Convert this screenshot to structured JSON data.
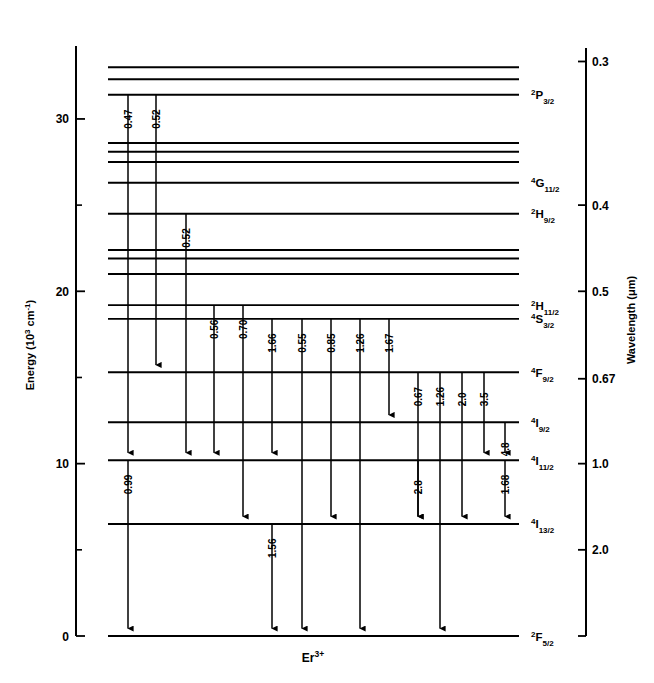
{
  "figure": {
    "ion_label": "Er 3+",
    "ion_label_base": "Er",
    "ion_label_sup": "3+"
  },
  "left_axis": {
    "title": "Energy (10³ cm⁻¹)",
    "title_main": "Energy (10",
    "title_sup": "3",
    "title_unit": " cm",
    "title_unit_sup": "-1",
    "title_close": ")",
    "major_ticks": [
      "0",
      "10",
      "20",
      "30"
    ],
    "minor_ticks": [
      "5",
      "15",
      "25"
    ],
    "range_min": 0,
    "range_max": 34
  },
  "right_axis": {
    "title": "Wavelength (μm)",
    "ticks": [
      "0.3",
      "0.4",
      "0.5",
      "0.67",
      "1.0",
      "2.0"
    ]
  },
  "chart_data": {
    "type": "diagram",
    "xlabel": "",
    "ylabel": "Energy (10³ cm⁻¹)",
    "ylim": [
      0,
      34
    ],
    "secondary_axis": {
      "label": "Wavelength (μm)",
      "ticks": [
        0.3,
        0.4,
        0.5,
        0.67,
        1.0,
        2.0
      ]
    },
    "levels": [
      {
        "label": "",
        "energy": 33.0,
        "term": "",
        "labeled": false
      },
      {
        "label": "",
        "energy": 32.3,
        "term": "",
        "labeled": false
      },
      {
        "label": "2P3/2",
        "energy": 31.4,
        "term_main": "P",
        "term_pre": "2",
        "term_sub": "3/2",
        "labeled": true
      },
      {
        "label": "",
        "energy": 28.6,
        "term": "",
        "labeled": false
      },
      {
        "label": "",
        "energy": 28.1,
        "term": "",
        "labeled": false
      },
      {
        "label": "",
        "energy": 27.5,
        "term": "",
        "labeled": false
      },
      {
        "label": "4G11/2",
        "energy": 26.3,
        "term_main": "G",
        "term_pre": "4",
        "term_sub": "11/2",
        "labeled": true
      },
      {
        "label": "2H9/2",
        "energy": 24.5,
        "term_main": "H",
        "term_pre": "2",
        "term_sub": "9/2",
        "labeled": true
      },
      {
        "label": "",
        "energy": 22.4,
        "term": "",
        "labeled": false
      },
      {
        "label": "",
        "energy": 21.9,
        "term": "",
        "labeled": false
      },
      {
        "label": "",
        "energy": 21.0,
        "term": "",
        "labeled": false
      },
      {
        "label": "2H11/2",
        "energy": 19.2,
        "term_main": "H",
        "term_pre": "2",
        "term_sub": "11/2",
        "labeled": true
      },
      {
        "label": "4S3/2",
        "energy": 18.4,
        "term_main": "S",
        "term_pre": "4",
        "term_sub": "3/2",
        "labeled": true
      },
      {
        "label": "4F9/2",
        "energy": 15.3,
        "term_main": "F",
        "term_pre": "4",
        "term_sub": "9/2",
        "labeled": true
      },
      {
        "label": "4I9/2",
        "energy": 12.4,
        "term_main": "I",
        "term_pre": "4",
        "term_sub": "9/2",
        "labeled": true
      },
      {
        "label": "4I11/2",
        "energy": 10.2,
        "term_main": "I",
        "term_pre": "4",
        "term_sub": "11/2",
        "labeled": true
      },
      {
        "label": "4I13/2",
        "energy": 6.5,
        "term_main": "I",
        "term_pre": "4",
        "term_sub": "13/2",
        "labeled": true
      },
      {
        "label": "2F5/2",
        "energy": 0.0,
        "term_main": "F",
        "term_pre": "2",
        "term_sub": "5/2",
        "labeled": true
      }
    ],
    "transitions": [
      {
        "label": "0.47",
        "from_level": 2,
        "to_level": 15,
        "column": 0
      },
      {
        "label": "0.52",
        "from_level": 2,
        "to_level": 13,
        "column": 1
      },
      {
        "label": "0.52",
        "from_level": 7,
        "to_level": 15,
        "column": 2
      },
      {
        "label": "0.56",
        "from_level": 11,
        "to_level": 15,
        "column": 3
      },
      {
        "label": "0.70",
        "from_level": 11,
        "to_level": 16,
        "column": 4
      },
      {
        "label": "1.66",
        "from_level": 12,
        "to_level": 15,
        "column": 5
      },
      {
        "label": "0.55",
        "from_level": 12,
        "to_level": 17,
        "column": 6
      },
      {
        "label": "0.85",
        "from_level": 12,
        "to_level": 16,
        "column": 7
      },
      {
        "label": "1.26",
        "from_level": 12,
        "to_level": 17,
        "column": 8
      },
      {
        "label": "1.67",
        "from_level": 12,
        "to_level": 14,
        "column": 9
      },
      {
        "label": "0.67",
        "from_level": 13,
        "to_level": 16,
        "column": 10
      },
      {
        "label": "1.26",
        "from_level": 13,
        "to_level": 17,
        "column": 11
      },
      {
        "label": "2.0",
        "from_level": 13,
        "to_level": 16,
        "column": 12
      },
      {
        "label": "3.5",
        "from_level": 13,
        "to_level": 15,
        "column": 13
      },
      {
        "label": "4.8",
        "from_level": 14,
        "to_level": 15,
        "column": 14
      },
      {
        "label": "0.99",
        "from_level": 15,
        "to_level": 17,
        "column": 0
      },
      {
        "label": "2.8",
        "from_level": 15,
        "to_level": 16,
        "column": 10
      },
      {
        "label": "1.68",
        "from_level": 15,
        "to_level": 16,
        "column": 14
      },
      {
        "label": "1.56",
        "from_level": 16,
        "to_level": 17,
        "column": 5
      }
    ]
  }
}
